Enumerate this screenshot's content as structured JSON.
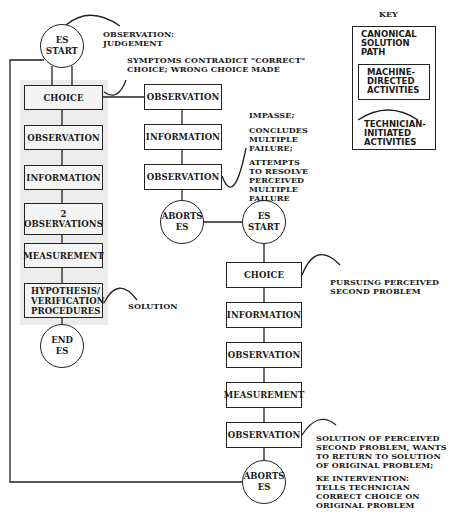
{
  "key": {
    "title": "KEY",
    "canonical": "CANONICAL\nSOLUTION\nPATH",
    "machine": "MACHINE-\nDIRECTED\nACTIVITIES",
    "technician": "TECHNICIAN-\nINITIATED\nACTIVITIES"
  },
  "left_column": {
    "start": "ES\nSTART",
    "boxes": [
      "CHOICE",
      "OBSERVATION",
      "INFORMATION",
      "2\nOBSERVATIONS",
      "MEASUREMENT",
      "HYPOTHESIS/\nVERIFICATION\nPROCEDURES"
    ],
    "end": "END\nES"
  },
  "middle_column": {
    "boxes": [
      "OBSERVATION",
      "INFORMATION",
      "OBSERVATION"
    ],
    "end": "ABORTS\nES"
  },
  "right_column": {
    "start": "ES\nSTART",
    "boxes": [
      "CHOICE",
      "INFORMATION",
      "OBSERVATION",
      "MEASUREMENT",
      "OBSERVATION"
    ],
    "end": "ABORTS\nES"
  },
  "annotations": {
    "obs_judgement": "OBSERVATION:\nJUDGEMENT",
    "symptoms": "SYMPTOMS CONTRADICT \"CORRECT\"\nCHOICE; WRONG CHOICE MADE",
    "impasse": "IMPASSE;",
    "concludes": "CONCLUDES\nMULTIPLE\nFAILURE;",
    "attempts": "ATTEMPTS\nTO RESOLVE\nPERCEIVED\nMULTIPLE\nFAILURE",
    "solution": "SOLUTION",
    "pursuing": "PURSUING PERCEIVED\nSECOND  PROBLEM",
    "solution_second": "SOLUTION OF PERCEIVED\nSECOND PROBLEM, WANTS\nTO RETURN TO SOLUTION\nOF ORIGINAL PROBLEM;",
    "ke_intervention": "KE INTERVENTION:\nTELLS TECHNICIAN\nCORRECT CHOICE ON\nORIGINAL PROBLEM"
  }
}
